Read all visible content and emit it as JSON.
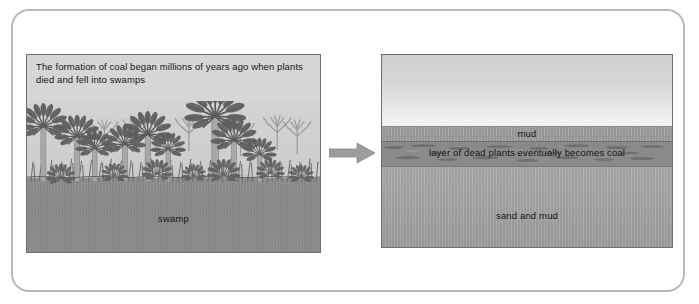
{
  "figure": {
    "frame_border_color": "#b9b9b9",
    "background": "#ffffff"
  },
  "arrow": {
    "icon": "right-arrow-icon",
    "direction": "right",
    "color": "#9a9a9a"
  },
  "panels": [
    {
      "id": "swamp",
      "caption": "The formation of coal began millions of years ago when plants died and fell into swamps",
      "scene": "prehistoric swamp with tree ferns and grasses",
      "labels": [
        {
          "name": "swamp-label",
          "text": "swamp"
        }
      ],
      "colors": {
        "sky": "#d2d2d2",
        "water": "#8c8c8c",
        "vegetation": "#6a6a6a",
        "caption_band": "#d6d6d6"
      }
    },
    {
      "id": "strata",
      "caption": "",
      "scene": "cross-section of sediment layers under water",
      "layers": [
        {
          "name": "water-layer",
          "text": ""
        },
        {
          "name": "mud-layer",
          "text": "mud"
        },
        {
          "name": "coal-layer",
          "text": "layer of dead plants eventually becomes coal"
        },
        {
          "name": "sand-mud-layer",
          "text": "sand and mud"
        }
      ],
      "colors": {
        "water": "#e0e0e0",
        "mud": "#9d9d9d",
        "dead_plants": "#8a8a8a",
        "sand_and_mud": "#a5a5a5"
      }
    }
  ]
}
